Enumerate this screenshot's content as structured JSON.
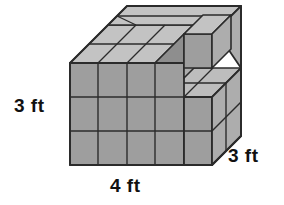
{
  "figure": {
    "shape_type": "3d-cube-stack",
    "grid": {
      "width_units": 4,
      "height_units": 3,
      "depth_units": 3
    },
    "colors": {
      "front_face": "#9e9e9e",
      "top_face": "#c3c3c3",
      "side_face": "#adadad",
      "inner_face": "#8e8e8e",
      "inner_top_face": "#bdbdbd",
      "edge": "#2b2b2b",
      "background": "#ffffff",
      "label_text": "#111111"
    }
  },
  "labels": {
    "height": "3 ft",
    "width": "4 ft",
    "depth": "3 ft"
  }
}
